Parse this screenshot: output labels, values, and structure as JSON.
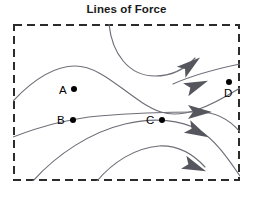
{
  "title": "Lines of Force",
  "colors": {
    "border": "#2b2b2b",
    "field_line": "#6e6e78",
    "arrow": "#56565e",
    "node": "#000000",
    "title": "#1a1a1a",
    "background": "#ffffff"
  },
  "border": {
    "style": "dashed",
    "dash_length_px": 8,
    "gap_length_px": 5,
    "thickness_px": 2
  },
  "nodes": [
    {
      "id": "A",
      "label": "A",
      "label_x": 46,
      "label_y": 61,
      "dot_x": 58,
      "dot_y": 62
    },
    {
      "id": "B",
      "label": "B",
      "label_x": 44,
      "label_y": 91,
      "dot_x": 57,
      "dot_y": 93
    },
    {
      "id": "C",
      "label": "C",
      "label_x": 133,
      "label_y": 91,
      "dot_x": 146,
      "dot_y": 93
    },
    {
      "id": "D",
      "label": "D",
      "label_x": 211,
      "label_y": 64,
      "dot_x": 213,
      "dot_y": 55
    }
  ],
  "field_lines": [
    {
      "name": "upper-left-crest",
      "path": "M 0 77 C 18 58, 40 42, 62 42 C 92 42, 118 78, 148 88 C 170 95, 196 83, 227 64"
    },
    {
      "name": "top-dip-loop",
      "path": "M 96 0 C 99 30, 116 52, 142 52 C 160 52, 172 45, 182 34"
    },
    {
      "name": "through-B-horizontal",
      "path": "M 0 113 C 26 103, 52 95, 86 92 C 120 89, 158 88, 186 88"
    },
    {
      "name": "lower-right-outflow",
      "path": "M 186 88 C 202 88, 216 95, 227 108"
    },
    {
      "name": "rising-from-bottom-left",
      "path": "M 20 157 C 44 130, 78 108, 112 100 C 142 93, 168 96, 186 106"
    },
    {
      "name": "lower-right-descend-1",
      "path": "M 186 106 C 202 116, 214 133, 227 152"
    },
    {
      "name": "rising-from-bottom-center",
      "path": "M 84 157 C 100 138, 122 124, 146 122 C 166 121, 180 130, 192 143"
    },
    {
      "name": "upper-right-inflow-to-D",
      "path": "M 160 60 C 178 52, 198 46, 227 40"
    }
  ],
  "arrows": [
    {
      "name": "arrow-upper",
      "x": 176,
      "y": 42,
      "angle": -38
    },
    {
      "name": "arrow-upper-mid",
      "x": 182,
      "y": 62,
      "angle": -22
    },
    {
      "name": "arrow-center",
      "x": 185,
      "y": 88,
      "angle": 0
    },
    {
      "name": "arrow-lower-mid",
      "x": 183,
      "y": 107,
      "angle": 27
    },
    {
      "name": "arrow-lower",
      "x": 180,
      "y": 142,
      "angle": 22
    }
  ]
}
